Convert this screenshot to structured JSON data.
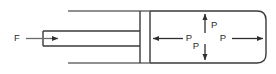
{
  "diagram": {
    "type": "physics-schematic",
    "canvas": {
      "width": 276,
      "height": 74,
      "background": "#ffffff"
    },
    "style": {
      "line_color": "#3a3a3a",
      "line_width": 1.4,
      "label_color": "#2b2b2b",
      "font_size_px": 9.5
    },
    "labels": {
      "force": "F",
      "pressure_left": "P",
      "pressure_up": "P",
      "pressure_down": "P",
      "pressure_right": "P"
    },
    "geometry": {
      "chamber": {
        "left": 150,
        "right": 266,
        "top": 11,
        "bottom": 63,
        "corner_radius": 9
      },
      "upper_wall": {
        "x1": 68,
        "y": 11,
        "x2": 150
      },
      "lower_wall": {
        "x1": 68,
        "y": 63,
        "x2": 150
      },
      "piston_plate": {
        "x": 140,
        "top": 11,
        "bottom": 63
      },
      "channel": {
        "top": 31,
        "bottom": 46,
        "left": 43,
        "right": 140
      },
      "force_arrow": {
        "x1": 26,
        "x2": 58,
        "y": 38.5
      },
      "arrow_left": {
        "x1": 183,
        "x2": 153,
        "y": 38.5
      },
      "arrow_right": {
        "x1": 232,
        "x2": 263,
        "y": 38.5
      },
      "arrow_up": {
        "x": 205,
        "y1": 33,
        "y2": 14
      },
      "arrow_down": {
        "x": 205,
        "y1": 44,
        "y2": 60
      }
    },
    "label_positions": {
      "force": {
        "x": 17,
        "y": 38.5
      },
      "pressure_left": {
        "x": 187,
        "y": 38.5
      },
      "pressure_up": {
        "x": 210,
        "y": 25
      },
      "pressure_down": {
        "x": 197,
        "y": 46
      },
      "pressure_right": {
        "x": 224,
        "y": 38.5
      }
    }
  }
}
